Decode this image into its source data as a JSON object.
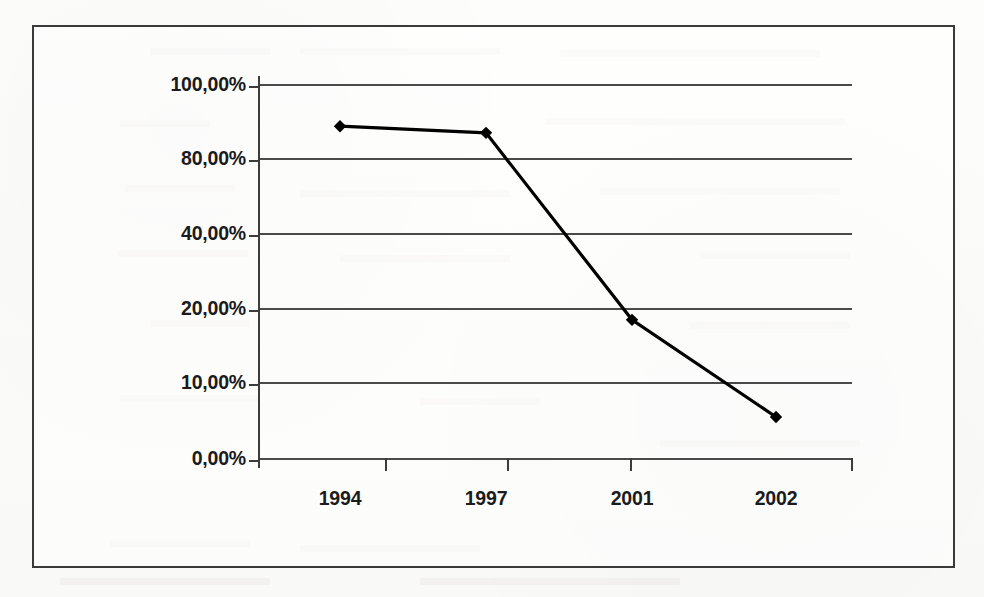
{
  "chart_data": {
    "type": "line",
    "title": "",
    "subtitle": "",
    "xlabel": "",
    "ylabel": "",
    "categories": [
      "1994",
      "1997",
      "2001",
      "2002"
    ],
    "series": [
      {
        "name": "",
        "values": [
          88.6,
          86.8,
          18.4,
          5.4
        ]
      }
    ],
    "value_format": "percent",
    "decimal_separator": ",",
    "ytick_labels": [
      "100,00%",
      "80,00%",
      "40,00%",
      "20,00%",
      "10,00%",
      "0,00%"
    ],
    "ytick_values": [
      100,
      80,
      40,
      20,
      10,
      0
    ],
    "ytick_note": "axis tick spacing is uniform in pixels but non-uniform in value",
    "ylim": [
      0,
      100
    ],
    "grid": true,
    "grid_axis": "y",
    "legend": "none",
    "marker": "diamond",
    "line_color": "#000000",
    "marker_color": "#000000",
    "grid_color": "#4a4a4a",
    "axis_color": "#3c3c3c",
    "frame_color": "#3a3a3a",
    "background_color": "#fbfbf9"
  },
  "axis": {
    "y_labels": [
      {
        "text": "100,00%",
        "top": 73
      },
      {
        "text": "80,00%",
        "top": 147
      },
      {
        "text": "40,00%",
        "top": 222
      },
      {
        "text": "20,00%",
        "top": 297
      },
      {
        "text": "10,00%",
        "top": 371
      },
      {
        "text": "0,00%",
        "top": 447
      }
    ],
    "x_labels": [
      {
        "text": "1994",
        "center": 340
      },
      {
        "text": "1997",
        "center": 486
      },
      {
        "text": "2001",
        "center": 632
      },
      {
        "text": "2002",
        "center": 776
      }
    ]
  }
}
